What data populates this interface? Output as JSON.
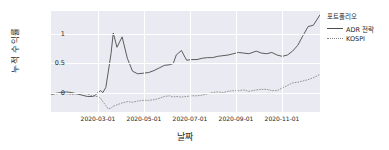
{
  "chart_data": {
    "type": "line",
    "title": "",
    "xlabel": "날짜",
    "ylabel": "누적 수익률",
    "grid": true,
    "legend_position": "right",
    "legend_title": "포트폴리오",
    "xlim": [
      "2020-01-02",
      "2020-12-30"
    ],
    "ylim": [
      -0.28,
      1.28
    ],
    "yticks": [
      0,
      0.5,
      1
    ],
    "ytick_labels": [
      "0",
      "0.5",
      "1"
    ],
    "xticks": [
      "2020-03-01",
      "2020-05-01",
      "2020-07-01",
      "2020-09-01",
      "2020-11-01"
    ],
    "xtick_labels": [
      "2020-03-01",
      "2020-05-01",
      "2020-07-01",
      "2020-09-01",
      "2020-11-01"
    ],
    "colors": {
      "adr": "#4c4c4c",
      "kospi": "#7f7f7f",
      "panel": "#eaeaf2",
      "grid": "#ffffff"
    },
    "series": [
      {
        "name": "ADR 전략",
        "style": "solid",
        "color": "#4c4c4c",
        "x": [
          "2020-01-02",
          "2020-01-09",
          "2020-01-16",
          "2020-01-23",
          "2020-01-30",
          "2020-02-06",
          "2020-02-13",
          "2020-02-20",
          "2020-02-27",
          "2020-03-02",
          "2020-03-05",
          "2020-03-09",
          "2020-03-12",
          "2020-03-16",
          "2020-03-19",
          "2020-03-23",
          "2020-03-26",
          "2020-03-31",
          "2020-04-07",
          "2020-04-14",
          "2020-04-21",
          "2020-04-28",
          "2020-05-06",
          "2020-05-13",
          "2020-05-20",
          "2020-05-27",
          "2020-06-03",
          "2020-06-10",
          "2020-06-15",
          "2020-06-19",
          "2020-06-26",
          "2020-07-03",
          "2020-07-10",
          "2020-07-17",
          "2020-07-24",
          "2020-07-31",
          "2020-08-07",
          "2020-08-14",
          "2020-08-21",
          "2020-08-28",
          "2020-09-04",
          "2020-09-11",
          "2020-09-18",
          "2020-09-25",
          "2020-10-05",
          "2020-10-12",
          "2020-10-19",
          "2020-10-26",
          "2020-11-02",
          "2020-11-09",
          "2020-11-16",
          "2020-11-23",
          "2020-11-30",
          "2020-12-07",
          "2020-12-14",
          "2020-12-21",
          "2020-12-30"
        ],
        "values": [
          -0.01,
          0.01,
          0.02,
          0.03,
          0.02,
          0.0,
          -0.02,
          -0.04,
          -0.04,
          -0.02,
          0.02,
          0.05,
          0.02,
          0.1,
          0.32,
          0.62,
          0.94,
          0.72,
          0.88,
          0.55,
          0.35,
          0.31,
          0.32,
          0.33,
          0.36,
          0.4,
          0.44,
          0.45,
          0.47,
          0.6,
          0.67,
          0.52,
          0.53,
          0.53,
          0.55,
          0.56,
          0.56,
          0.58,
          0.59,
          0.6,
          0.62,
          0.64,
          0.63,
          0.62,
          0.66,
          0.63,
          0.62,
          0.64,
          0.6,
          0.58,
          0.6,
          0.66,
          0.75,
          0.9,
          1.04,
          1.06,
          1.22
        ]
      },
      {
        "name": "KOSPI",
        "style": "dotted",
        "color": "#7f7f7f",
        "x": [
          "2020-01-02",
          "2020-01-09",
          "2020-01-16",
          "2020-01-23",
          "2020-01-30",
          "2020-02-06",
          "2020-02-13",
          "2020-02-20",
          "2020-02-27",
          "2020-03-02",
          "2020-03-05",
          "2020-03-09",
          "2020-03-12",
          "2020-03-16",
          "2020-03-19",
          "2020-03-23",
          "2020-03-26",
          "2020-03-31",
          "2020-04-07",
          "2020-04-14",
          "2020-04-21",
          "2020-04-28",
          "2020-05-06",
          "2020-05-13",
          "2020-05-20",
          "2020-05-27",
          "2020-06-03",
          "2020-06-10",
          "2020-06-15",
          "2020-06-19",
          "2020-06-26",
          "2020-07-03",
          "2020-07-10",
          "2020-07-17",
          "2020-07-24",
          "2020-07-31",
          "2020-08-07",
          "2020-08-14",
          "2020-08-21",
          "2020-08-28",
          "2020-09-04",
          "2020-09-11",
          "2020-09-18",
          "2020-09-25",
          "2020-10-05",
          "2020-10-12",
          "2020-10-19",
          "2020-10-26",
          "2020-11-02",
          "2020-11-09",
          "2020-11-16",
          "2020-11-23",
          "2020-11-30",
          "2020-12-07",
          "2020-12-14",
          "2020-12-21",
          "2020-12-30"
        ],
        "values": [
          -0.005,
          0.0,
          0.01,
          0.0,
          -0.01,
          0.0,
          0.01,
          0.0,
          -0.03,
          -0.04,
          -0.04,
          -0.07,
          -0.12,
          -0.18,
          -0.23,
          -0.22,
          -0.19,
          -0.17,
          -0.14,
          -0.12,
          -0.13,
          -0.11,
          -0.1,
          -0.1,
          -0.09,
          -0.07,
          -0.04,
          -0.03,
          -0.05,
          -0.04,
          -0.05,
          -0.04,
          -0.03,
          -0.03,
          -0.02,
          0.0,
          0.02,
          0.03,
          0.02,
          0.04,
          0.05,
          0.05,
          0.06,
          0.04,
          0.06,
          0.07,
          0.07,
          0.05,
          0.05,
          0.09,
          0.13,
          0.17,
          0.18,
          0.2,
          0.22,
          0.25,
          0.3
        ]
      }
    ]
  },
  "legend": {
    "title": "포트폴리오",
    "items": [
      {
        "label": "ADR 전략",
        "style": "solid"
      },
      {
        "label": "KOSPI",
        "style": "dotted"
      }
    ]
  },
  "axes": {
    "ylabel": "누적 수익률",
    "xlabel": "날짜",
    "ytick_labels": [
      "1",
      "0.5",
      "0"
    ],
    "xtick_labels": [
      "2020-03-01",
      "2020-05-01",
      "2020-07-01",
      "2020-09-01",
      "2020-11-01"
    ]
  }
}
